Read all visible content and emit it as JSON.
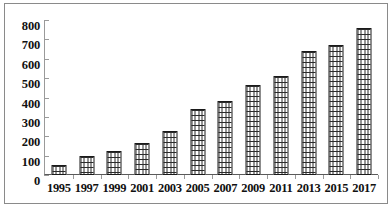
{
  "chart_data": {
    "type": "bar",
    "title": "",
    "subtitle": "",
    "xlabel": "",
    "ylabel": "",
    "categories": [
      "1995",
      "1997",
      "1999",
      "2001",
      "2003",
      "2005",
      "2007",
      "2009",
      "2011",
      "2013",
      "2015",
      "2017"
    ],
    "values": [
      50,
      100,
      125,
      165,
      225,
      340,
      380,
      465,
      510,
      640,
      670,
      758
    ],
    "ylim": [
      0,
      800
    ],
    "y_ticks": [
      0,
      100,
      200,
      300,
      400,
      500,
      600,
      700,
      800
    ],
    "y_tick_labels": [
      "0",
      "100",
      "200",
      "300",
      "400",
      "500",
      "600",
      "700",
      "800"
    ],
    "grid": false,
    "legend": null,
    "legend_position": "none",
    "annotations": [],
    "series": [
      {
        "name": "",
        "values": [
          50,
          100,
          125,
          165,
          225,
          340,
          380,
          465,
          510,
          640,
          670,
          758
        ]
      }
    ],
    "bar_fill_pattern": "brick-hatch",
    "bar_fill_color": "#ffffff",
    "bar_border_color": "#1a1a1a",
    "axis_color": "#5a5a5a",
    "frame_color": "#8a8a8a",
    "background_color": "#ffffff",
    "text_color": "#111111"
  }
}
